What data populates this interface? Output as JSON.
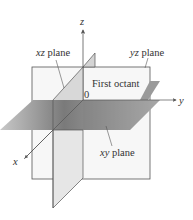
{
  "diagram": {
    "axes": {
      "x": {
        "label": "x"
      },
      "y": {
        "label": "y"
      },
      "z": {
        "label": "z"
      },
      "origin": {
        "label": "0"
      }
    },
    "planes": {
      "xz": {
        "label_var": "xz",
        "label_word": "plane"
      },
      "yz": {
        "label_var": "yz",
        "label_word": "plane"
      },
      "xy": {
        "label_var": "xy",
        "label_word": "plane"
      }
    },
    "region_label": "First octant",
    "colors": {
      "line": "#555555",
      "yz_fill": "#f6f6f6",
      "xz_fill": "#d6d6d6",
      "xy_dark": "#5e5e5e",
      "xy_light": "#d8d8d8",
      "text": "#333333"
    }
  }
}
